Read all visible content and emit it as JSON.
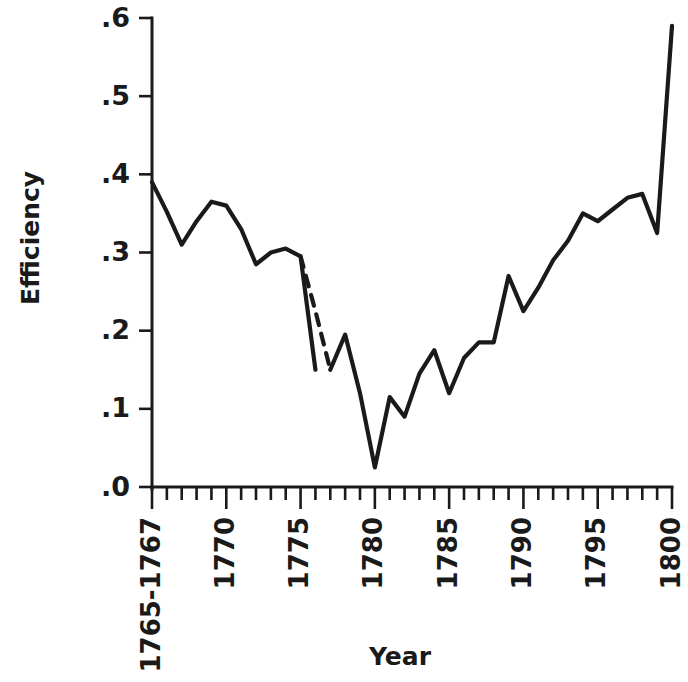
{
  "chart_data": {
    "type": "line",
    "title": "",
    "xlabel": "Year",
    "ylabel": "Efficiency",
    "xlim": [
      1765,
      1800
    ],
    "ylim": [
      0.0,
      0.6
    ],
    "grid": false,
    "legend": null,
    "y_ticks": [
      ".0",
      ".1",
      ".2",
      ".3",
      ".4",
      ".5",
      ".6"
    ],
    "y_tick_values": [
      0.0,
      0.1,
      0.2,
      0.3,
      0.4,
      0.5,
      0.6
    ],
    "x_ticks": [
      "1765-1767",
      "1770",
      "1775",
      "1780",
      "1785",
      "1790",
      "1795",
      "1800"
    ],
    "x_tick_values": [
      1765,
      1770,
      1775,
      1780,
      1785,
      1790,
      1795,
      1800
    ],
    "x_minor_tick_step": 1,
    "line_color": "#1a1a1a",
    "annotations": [
      {
        "text": "dashed segment indicates interpolated / missing data 1776-1778"
      }
    ],
    "series": [
      {
        "name": "Efficiency",
        "style": "solid",
        "x": [
          1765,
          1766,
          1767,
          1768,
          1769,
          1770,
          1771,
          1772,
          1773,
          1774,
          1775,
          1776
        ],
        "values": [
          0.39,
          0.352,
          0.31,
          0.34,
          0.365,
          0.36,
          0.33,
          0.285,
          0.3,
          0.305,
          0.295,
          0.15
        ]
      },
      {
        "name": "Efficiency (interpolated)",
        "style": "dashed",
        "x": [
          1775,
          1776,
          1777
        ],
        "values": [
          0.295,
          0.225,
          0.15
        ]
      },
      {
        "name": "Efficiency (continued)",
        "style": "solid",
        "x": [
          1777,
          1778,
          1779,
          1780,
          1781,
          1782,
          1783,
          1784,
          1785,
          1786,
          1787,
          1788,
          1789,
          1790,
          1791,
          1792,
          1793,
          1794,
          1795,
          1796,
          1797,
          1798,
          1799,
          1800
        ],
        "values": [
          0.15,
          0.195,
          0.12,
          0.025,
          0.115,
          0.09,
          0.145,
          0.175,
          0.12,
          0.165,
          0.185,
          0.185,
          0.27,
          0.225,
          0.255,
          0.29,
          0.315,
          0.35,
          0.34,
          0.355,
          0.37,
          0.375,
          0.325,
          0.59
        ]
      }
    ]
  },
  "figure": {
    "ylabel": "Efficiency",
    "xlabel": "Year",
    "y_tick_labels": [
      ".0",
      ".1",
      ".2",
      ".3",
      ".4",
      ".5",
      ".6"
    ],
    "x_tick_labels": [
      "1765-1767",
      "1770",
      "1775",
      "1780",
      "1785",
      "1790",
      "1795",
      "1800"
    ]
  }
}
